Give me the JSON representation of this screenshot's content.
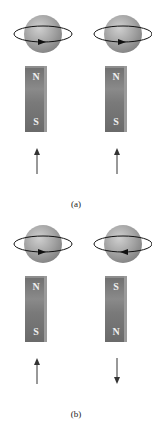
{
  "figure": {
    "panels": [
      {
        "label": "(a)",
        "items": [
          {
            "spin": "counterclockwise-front-right",
            "magnet": {
              "top": "N",
              "bottom": "S"
            },
            "arrow": "up"
          },
          {
            "spin": "counterclockwise-front-right",
            "magnet": {
              "top": "N",
              "bottom": "S"
            },
            "arrow": "up"
          }
        ]
      },
      {
        "label": "(b)",
        "items": [
          {
            "spin": "front-right",
            "magnet": {
              "top": "N",
              "bottom": "S"
            },
            "arrow": "up"
          },
          {
            "spin": "front-left",
            "magnet": {
              "top": "S",
              "bottom": "N"
            },
            "arrow": "down"
          }
        ]
      }
    ],
    "colors": {
      "sphere": "#9a9a9a",
      "magnet": "#777777",
      "pole_text": "#f0f0f0",
      "arrow": "#333333",
      "orbit": "#111111"
    }
  }
}
